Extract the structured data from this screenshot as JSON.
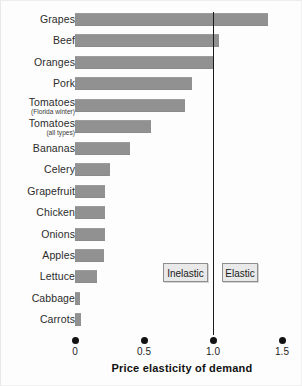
{
  "chart_data": {
    "type": "bar",
    "orientation": "horizontal",
    "title": "",
    "subtitle": "",
    "xlabel": "Price elasticity of demand",
    "ylabel": "",
    "xlim": [
      0,
      1.5
    ],
    "xticks": [
      "0",
      "0.5",
      "1.0",
      "1.5"
    ],
    "xtick_values": [
      0,
      0.5,
      1.0,
      1.5
    ],
    "grid": false,
    "legend": "none",
    "reference_line": {
      "value": 1.0,
      "label": "unit elasticity",
      "color": "#1b1b1b"
    },
    "bar_color": "#919191",
    "categories": [
      "Grapes",
      "Beef",
      "Oranges",
      "Pork",
      "Tomatoes",
      "Tomatoes",
      "Bananas",
      "Celery",
      "Grapefruit",
      "Chicken",
      "Onions",
      "Apples",
      "Lettuce",
      "Cabbage",
      "Carrots"
    ],
    "category_sublabels": [
      "",
      "",
      "",
      "",
      "(Florida winter)",
      "(all types)",
      "",
      "",
      "",
      "",
      "",
      "",
      "",
      "",
      ""
    ],
    "values": [
      1.4,
      1.04,
      1.0,
      0.85,
      0.8,
      0.55,
      0.4,
      0.25,
      0.22,
      0.22,
      0.22,
      0.21,
      0.16,
      0.03,
      0.04
    ],
    "annotations": [
      {
        "text": "Inelastic",
        "x_range": [
          0,
          1.0
        ]
      },
      {
        "text": "Elastic",
        "x_range": [
          1.0,
          1.5
        ]
      }
    ]
  },
  "rows": [
    {
      "label": "Grapes",
      "sub": "",
      "value": "1.40"
    },
    {
      "label": "Beef",
      "sub": "",
      "value": "1.04"
    },
    {
      "label": "Oranges",
      "sub": "",
      "value": "1.00"
    },
    {
      "label": "Pork",
      "sub": "",
      "value": "0.85"
    },
    {
      "label": "Tomatoes",
      "sub": "(Florida winter)",
      "value": "0.80"
    },
    {
      "label": "Tomatoes",
      "sub": "(all types)",
      "value": "0.55"
    },
    {
      "label": "Bananas",
      "sub": "",
      "value": "0.40"
    },
    {
      "label": "Celery",
      "sub": "",
      "value": "0.25"
    },
    {
      "label": "Grapefruit",
      "sub": "",
      "value": "0.22"
    },
    {
      "label": "Chicken",
      "sub": "",
      "value": "0.22"
    },
    {
      "label": "Onions",
      "sub": "",
      "value": "0.22"
    },
    {
      "label": "Apples",
      "sub": "",
      "value": "0.21"
    },
    {
      "label": "Lettuce",
      "sub": "",
      "value": "0.16"
    },
    {
      "label": "Cabbage",
      "sub": "",
      "value": "0.03"
    },
    {
      "label": "Carrots",
      "sub": "",
      "value": "0.04"
    }
  ],
  "axis": {
    "title": "Price elasticity of demand",
    "ticks": [
      {
        "label": "0",
        "value": 0
      },
      {
        "label": "0.5",
        "value": 0.5
      },
      {
        "label": "1.0",
        "value": 1.0
      },
      {
        "label": "1.5",
        "value": 1.5
      }
    ]
  },
  "annotations": {
    "inelastic": "Inelastic",
    "elastic": "Elastic"
  },
  "colors": {
    "bar": "#919191",
    "reference_line": "#1b1b1b",
    "annotation_fill": "#e9e9e9",
    "annotation_border": "#8e8e8e",
    "text": "#1d1d1d",
    "background": "#fdfdfd"
  }
}
